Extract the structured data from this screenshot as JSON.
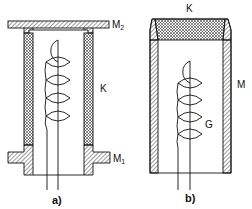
{
  "figures": [
    {
      "id": "a",
      "caption": "a)",
      "labels": {
        "top_flange": "M",
        "top_flange_sub": "2",
        "tube": "K",
        "bottom_flange": "M",
        "bottom_flange_sub": "1"
      }
    },
    {
      "id": "b",
      "caption": "b)",
      "labels": {
        "cap": "K",
        "housing": "M",
        "coil": "G"
      }
    }
  ],
  "colors": {
    "line": "#111111",
    "background": "#ffffff"
  }
}
